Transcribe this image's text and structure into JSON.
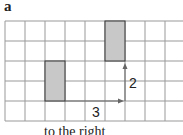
{
  "panel_label": "a",
  "grid": {
    "cols": 9,
    "rows": 5,
    "cell_px": 20
  },
  "shapes": [
    {
      "name": "original",
      "col": 2,
      "row": 2,
      "w": 1,
      "h": 2,
      "fill": "#c8c8c8"
    },
    {
      "name": "translated",
      "col": 5,
      "row": 0,
      "w": 1,
      "h": 2,
      "fill": "#c8c8c8"
    }
  ],
  "arrows": {
    "horizontal_label": "3",
    "vertical_label": "2"
  },
  "caption": "to the right"
}
